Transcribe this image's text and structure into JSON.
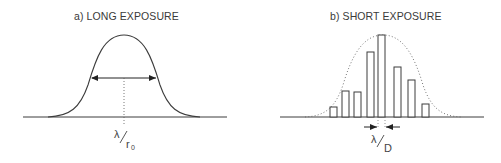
{
  "panels": [
    {
      "id": "a",
      "title": "a)  LONG EXPOSURE",
      "label_main": "λ",
      "label_sub": "r",
      "label_subsub": "0",
      "description": "Smooth seeing-limited profile with FWHM arrow"
    },
    {
      "id": "b",
      "title": "b)  SHORT EXPOSURE",
      "label_main": "λ",
      "label_sub": "D",
      "description": "Speckle bars under dotted envelope with width arrows"
    }
  ],
  "speckle_bars": [
    {
      "x": 330,
      "w": 7,
      "top": 107
    },
    {
      "x": 342,
      "w": 7,
      "top": 91
    },
    {
      "x": 354,
      "w": 7,
      "top": 92
    },
    {
      "x": 367,
      "w": 7,
      "top": 52
    },
    {
      "x": 378,
      "w": 7,
      "top": 35
    },
    {
      "x": 394,
      "w": 7,
      "top": 67
    },
    {
      "x": 408,
      "w": 7,
      "top": 80
    },
    {
      "x": 422,
      "w": 7,
      "top": 104
    }
  ],
  "colors": {
    "line": "#3c3c3c",
    "dots": "#666666",
    "text": "#3a3a3a"
  }
}
